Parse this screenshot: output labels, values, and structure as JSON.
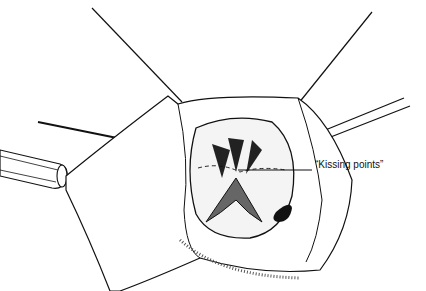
{
  "figure": {
    "type": "surgical illustration",
    "annotations": [
      {
        "text": "“Kissing points”"
      }
    ]
  }
}
